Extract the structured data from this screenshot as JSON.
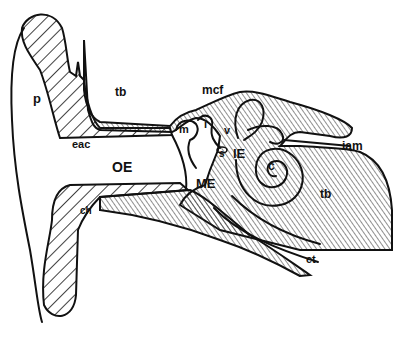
{
  "diagram": {
    "type": "anatomical-cross-section",
    "colors": {
      "ink": "#111111",
      "background": "#ffffff"
    },
    "labels": [
      {
        "id": "p",
        "text": "p",
        "x": 33,
        "y": 103,
        "size": 13
      },
      {
        "id": "tb1",
        "text": "tb",
        "x": 115,
        "y": 96,
        "size": 12
      },
      {
        "id": "mcf",
        "text": "mcf",
        "x": 202,
        "y": 94,
        "size": 12
      },
      {
        "id": "m",
        "text": "m",
        "x": 179,
        "y": 133,
        "size": 11
      },
      {
        "id": "i",
        "text": "i",
        "x": 204,
        "y": 128,
        "size": 11
      },
      {
        "id": "v",
        "text": "v",
        "x": 224,
        "y": 134,
        "size": 11
      },
      {
        "id": "s",
        "text": "s",
        "x": 219,
        "y": 157,
        "size": 10
      },
      {
        "id": "IE",
        "text": "IE",
        "x": 233,
        "y": 158,
        "size": 13
      },
      {
        "id": "c",
        "text": "c",
        "x": 268,
        "y": 170,
        "size": 12
      },
      {
        "id": "iam",
        "text": "iam",
        "x": 342,
        "y": 150,
        "size": 12
      },
      {
        "id": "eac",
        "text": "eac",
        "x": 72,
        "y": 148,
        "size": 11
      },
      {
        "id": "OE",
        "text": "OE",
        "x": 112,
        "y": 172,
        "size": 14
      },
      {
        "id": "ME",
        "text": "ME",
        "x": 196,
        "y": 188,
        "size": 13
      },
      {
        "id": "tb2",
        "text": "tb",
        "x": 320,
        "y": 198,
        "size": 12
      },
      {
        "id": "et",
        "text": "et",
        "x": 306,
        "y": 263,
        "size": 11
      },
      {
        "id": "dr",
        "text": "ch",
        "x": 80,
        "y": 214,
        "size": 10
      }
    ]
  }
}
